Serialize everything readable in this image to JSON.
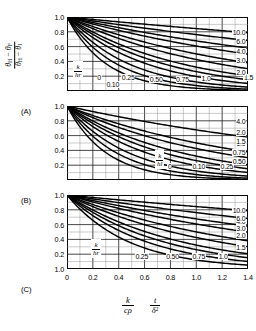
{
  "figure": {
    "ylabel": {
      "numerator": "θH − θF",
      "denominator": "θH − θI",
      "num_sym1": "θ",
      "num_sub1": "H",
      "num_minus": " − ",
      "num_sym2": "θ",
      "num_sub2": "F",
      "den_sym1": "θ",
      "den_sub1": "H",
      "den_sym2": "θ",
      "den_sub2": "I"
    },
    "xlabel": {
      "frac1_num": "k",
      "frac1_den": "cρ",
      "frac2_num": "t",
      "frac2_den": "δ",
      "frac2_den_sup": "2",
      "full": "(k/cρ)(t/δ²)"
    },
    "param_label": {
      "num": "k",
      "den": "hr"
    },
    "param_label_b": {
      "num": "k",
      "den": "hl"
    },
    "panels": [
      {
        "letter": "(A)"
      },
      {
        "letter": "(B)"
      },
      {
        "letter": "(C)"
      }
    ]
  },
  "chart_data": {
    "type": "line",
    "title": "",
    "xlabel": "(k/cρ)(t/δ²)",
    "ylabel": "(θH − θF)/(θH − θI)",
    "xlim": [
      0,
      1.4
    ],
    "ylim": [
      0,
      1.0
    ],
    "xticks": [
      "0",
      "0.2",
      "0.4",
      "0.6",
      "0.8",
      "1.0",
      "1.2",
      "1.4"
    ],
    "xtick_values": [
      0,
      0.2,
      0.4,
      0.6,
      0.8,
      1.0,
      1.2,
      1.4
    ],
    "yticks": [
      "1.0",
      "0.8",
      "0.6",
      "0.4",
      "0.2"
    ],
    "ytick_values": [
      1.0,
      0.8,
      0.6,
      0.4,
      0.2
    ],
    "grid": true,
    "legend_position": "inline-curve-labels",
    "series_parameter": "k/hr",
    "panels": [
      {
        "letter": "(A)",
        "param_symbol": "k/hr",
        "ylabel_bottom_tick": "",
        "curves": [
          {
            "label": "0",
            "slope_decay": 3.3,
            "label_pos": "inline",
            "lx": 0.165,
            "ly": 0.175
          },
          {
            "label": "0.10",
            "slope_decay": 2.62,
            "label_pos": "inline",
            "lx": 0.215,
            "ly": 0.085
          },
          {
            "label": "0.25",
            "slope_decay": 2.1,
            "label_pos": "inline",
            "lx": 0.3,
            "ly": 0.175
          },
          {
            "label": "0.50",
            "slope_decay": 1.63,
            "label_pos": "inline",
            "lx": 0.455,
            "ly": 0.15
          },
          {
            "label": "0.75",
            "slope_decay": 1.34,
            "label_pos": "inline",
            "lx": 0.6,
            "ly": 0.145
          },
          {
            "label": "1.0",
            "slope_decay": 1.13,
            "label_pos": "inline",
            "lx": 0.74,
            "ly": 0.16
          },
          {
            "label": "1.5",
            "slope_decay": 0.855,
            "label_pos": "inline",
            "lx": 0.975,
            "ly": 0.18
          },
          {
            "label": "2.0",
            "slope_decay": 0.69,
            "label_pos": "right",
            "ly": 0.245
          },
          {
            "label": "3.0",
            "slope_decay": 0.498,
            "label_pos": "right",
            "ly": 0.41
          },
          {
            "label": "4.0",
            "slope_decay": 0.39,
            "label_pos": "right",
            "ly": 0.53
          },
          {
            "label": "6.0",
            "slope_decay": 0.272,
            "label_pos": "right",
            "ly": 0.66
          },
          {
            "label": "10.0",
            "slope_decay": 0.17,
            "label_pos": "right",
            "ly": 0.79
          }
        ]
      },
      {
        "letter": "(B)",
        "param_symbol": "k/hl",
        "curves": [
          {
            "label": "0",
            "slope_decay": 3.3,
            "label_pos": "inline",
            "lx": 0.555,
            "ly": 0.175
          },
          {
            "label": "0.10",
            "slope_decay": 2.62,
            "label_pos": "inline",
            "lx": 0.69,
            "ly": 0.175
          },
          {
            "label": "0.25",
            "slope_decay": 2.1,
            "label_pos": "inline",
            "lx": 0.845,
            "ly": 0.175
          },
          {
            "label": "0.50",
            "slope_decay": 1.63,
            "label_pos": "right",
            "ly": 0.245
          },
          {
            "label": "0.75",
            "slope_decay": 1.34,
            "label_pos": "right",
            "ly": 0.37
          },
          {
            "label": "1.0",
            "slope_decay": 1.13,
            "label_pos": "right",
            "ly": 0.49
          },
          {
            "label": "1.5",
            "slope_decay": 0.855,
            "label_pos": "right",
            "ly": 0.52
          },
          {
            "label": "2.0",
            "slope_decay": 0.69,
            "label_pos": "right",
            "ly": 0.64
          },
          {
            "label": "4.0",
            "slope_decay": 0.39,
            "label_pos": "right",
            "ly": 0.79
          }
        ]
      },
      {
        "letter": "(C)",
        "param_symbol": "k/hr",
        "curves": [
          {
            "label": "0.25",
            "slope_decay": 2.1,
            "label_pos": "inline",
            "lx": 0.375,
            "ly": 0.165
          },
          {
            "label": "0.50",
            "slope_decay": 1.63,
            "label_pos": "inline",
            "lx": 0.545,
            "ly": 0.165
          },
          {
            "label": "0.75",
            "slope_decay": 1.34,
            "label_pos": "inline",
            "lx": 0.69,
            "ly": 0.165
          },
          {
            "label": "1.0",
            "slope_decay": 1.13,
            "label_pos": "inline",
            "lx": 0.835,
            "ly": 0.165
          },
          {
            "label": "1.5",
            "slope_decay": 0.855,
            "label_pos": "right",
            "ly": 0.285
          },
          {
            "label": "2.0",
            "slope_decay": 0.69,
            "label_pos": "right",
            "ly": 0.445
          },
          {
            "label": "3.0",
            "slope_decay": 0.498,
            "label_pos": "right",
            "ly": 0.545
          },
          {
            "label": "4.0",
            "slope_decay": 0.39,
            "label_pos": "right",
            "ly": 0.64
          },
          {
            "label": "6.0",
            "slope_decay": 0.272,
            "label_pos": "right",
            "ly": 0.68
          },
          {
            "label": "10.0",
            "slope_decay": 0.17,
            "label_pos": "right",
            "ly": 0.79
          }
        ]
      }
    ]
  }
}
